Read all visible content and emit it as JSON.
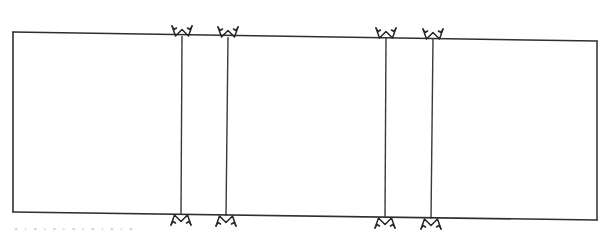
{
  "document": {
    "kind": "scanned-hand-drawn-diagram",
    "description": "Hand-drawn rectangular outline divided into panels by four vertical lines, each vertical line capped top and bottom by a bowtie / butterfly seam marker.",
    "background_color": "#ffffff",
    "ink_color": "#2b2b2b",
    "ink_color_light": "#5a5a5a"
  },
  "figure": {
    "frame": {
      "name": "outer-rectangle",
      "top_left": {
        "x": 13,
        "y": 32
      },
      "top_right": {
        "x": 597,
        "y": 41
      },
      "bottom_right": {
        "x": 597,
        "y": 220
      },
      "bottom_left": {
        "x": 13,
        "y": 212
      },
      "stroke_width": 1.6
    },
    "dividers": [
      {
        "name": "divider-1",
        "x_top": 182,
        "y_top": 36,
        "x_bottom": 181,
        "y_bottom": 215,
        "stroke_width": 1.5
      },
      {
        "name": "divider-2",
        "x_top": 228,
        "y_top": 37,
        "x_bottom": 226,
        "y_bottom": 216,
        "stroke_width": 1.5
      },
      {
        "name": "divider-3",
        "x_top": 386,
        "y_top": 38,
        "x_bottom": 385,
        "y_bottom": 218,
        "stroke_width": 1.5
      },
      {
        "name": "divider-4",
        "x_top": 433,
        "y_top": 39,
        "x_bottom": 431,
        "y_bottom": 219,
        "stroke_width": 1.5
      }
    ],
    "markers": {
      "shape": "bowtie-seam-marker",
      "count": 8,
      "top": [
        {
          "name": "bowtie-marker-top-1",
          "cx": 182,
          "cy": 36
        },
        {
          "name": "bowtie-marker-top-2",
          "cx": 228,
          "cy": 37
        },
        {
          "name": "bowtie-marker-top-3",
          "cx": 386,
          "cy": 38
        },
        {
          "name": "bowtie-marker-top-4",
          "cx": 433,
          "cy": 39
        }
      ],
      "bottom": [
        {
          "name": "bowtie-marker-bottom-1",
          "cx": 181,
          "cy": 215
        },
        {
          "name": "bowtie-marker-bottom-2",
          "cx": 226,
          "cy": 216
        },
        {
          "name": "bowtie-marker-bottom-3",
          "cx": 385,
          "cy": 218
        },
        {
          "name": "bowtie-marker-bottom-4",
          "cx": 431,
          "cy": 219
        }
      ]
    },
    "panels": [
      {
        "name": "panel-1",
        "x_start": 13,
        "x_end": 182
      },
      {
        "name": "panel-2",
        "x_start": 182,
        "x_end": 228
      },
      {
        "name": "panel-3",
        "x_start": 228,
        "x_end": 386
      },
      {
        "name": "panel-4",
        "x_start": 386,
        "x_end": 433
      },
      {
        "name": "panel-5",
        "x_start": 433,
        "x_end": 597
      }
    ]
  },
  "caption": {
    "text": "I . I . I . I . I . I . I",
    "note": "cut-off partial text line at bottom edge of scan; only letter tops visible"
  }
}
